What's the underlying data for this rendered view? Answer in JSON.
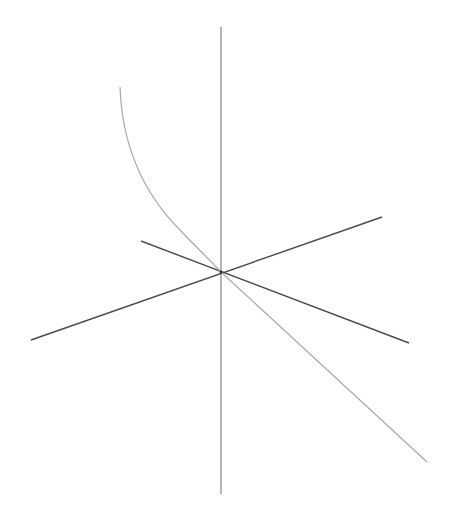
{
  "figure": {
    "type": "3d-axes-with-curve",
    "width": 450,
    "height": 518,
    "background": "#ffffff",
    "origin": [
      221,
      272
    ],
    "axes": [
      {
        "name": "vertical-axis",
        "from": [
          221,
          27
        ],
        "to": [
          221,
          494
        ],
        "color": "#7a7a7a",
        "width": 1.1
      },
      {
        "name": "axis-a",
        "from": [
          31,
          340
        ],
        "to": [
          382,
          217
        ],
        "color": "#4a4a4a",
        "width": 1.4
      },
      {
        "name": "axis-b",
        "from": [
          141,
          241
        ],
        "to": [
          409,
          343
        ],
        "color": "#4a4a4a",
        "width": 1.4
      }
    ],
    "curve": {
      "name": "parametric-curve",
      "color": "#a8a8a8",
      "width": 1.2,
      "path": "M120,87 C122,140 140,190 180,230 C195,246 210,260 221,272 L427,462"
    },
    "labels": []
  }
}
